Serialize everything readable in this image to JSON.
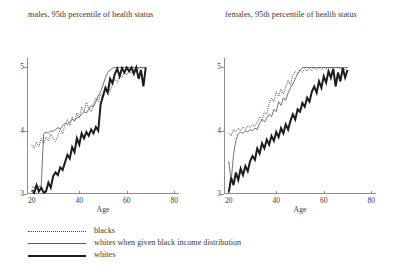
{
  "chart_data": [
    {
      "type": "line",
      "title": "males, 95th percentile of health status",
      "xlabel": "Age",
      "ylabel": "",
      "xlim": [
        18,
        82
      ],
      "ylim": [
        3,
        5.15
      ],
      "xticks": [
        20,
        40,
        60,
        80
      ],
      "yticks": [
        3,
        4,
        5
      ],
      "grid": false,
      "legend_position": "below-figure",
      "series": [
        {
          "name": "blacks",
          "style": "dotted",
          "x": [
            20,
            21,
            22,
            23,
            24,
            25,
            26,
            27,
            28,
            29,
            30,
            31,
            32,
            33,
            34,
            35,
            36,
            37,
            38,
            39,
            40,
            41,
            42,
            43,
            44,
            45,
            46,
            47,
            48,
            49,
            50,
            51,
            52,
            53,
            54,
            55,
            56,
            57,
            58,
            59,
            60,
            61,
            62,
            63,
            64,
            65,
            66,
            67,
            68
          ],
          "values": [
            3.78,
            3.72,
            3.82,
            3.75,
            3.88,
            3.8,
            3.9,
            3.84,
            3.95,
            3.88,
            3.83,
            3.92,
            4.02,
            3.95,
            4.1,
            4.18,
            4.08,
            4.22,
            4.15,
            4.28,
            4.2,
            4.38,
            4.3,
            4.45,
            4.36,
            4.3,
            4.42,
            4.52,
            4.46,
            4.58,
            4.52,
            4.64,
            4.7,
            4.62,
            4.74,
            4.82,
            4.76,
            4.88,
            4.84,
            4.92,
            4.88,
            4.95,
            4.9,
            4.97,
            4.93,
            4.99,
            4.95,
            5.0,
            4.98
          ]
        },
        {
          "name": "whites when given black income distribution",
          "style": "thin-solid",
          "x": [
            20,
            21,
            22,
            23,
            24,
            25,
            26,
            27,
            28,
            29,
            30,
            31,
            32,
            33,
            34,
            35,
            36,
            37,
            38,
            39,
            40,
            41,
            42,
            43,
            44,
            45,
            46,
            47,
            48,
            49,
            50,
            51,
            52,
            53,
            54,
            55,
            56,
            57,
            58,
            59,
            60,
            61,
            62,
            63,
            64,
            65,
            66,
            67,
            68
          ],
          "values": [
            3.12,
            3.1,
            3.13,
            3.11,
            3.14,
            3.95,
            3.98,
            3.96,
            4.0,
            3.99,
            4.02,
            4.05,
            4.03,
            4.08,
            4.12,
            4.1,
            4.14,
            4.18,
            4.16,
            4.2,
            4.22,
            4.26,
            4.3,
            4.28,
            4.34,
            4.4,
            4.38,
            4.46,
            4.55,
            4.62,
            4.72,
            4.84,
            4.92,
            4.96,
            4.99,
            5.0,
            5.0,
            5.0,
            5.0,
            5.0,
            5.0,
            5.0,
            5.0,
            5.0,
            5.0,
            5.0,
            5.0,
            5.0,
            5.0
          ]
        },
        {
          "name": "whites",
          "style": "thick-solid",
          "x": [
            20,
            21,
            22,
            23,
            24,
            25,
            26,
            27,
            28,
            29,
            30,
            31,
            32,
            33,
            34,
            35,
            36,
            37,
            38,
            39,
            40,
            41,
            42,
            43,
            44,
            45,
            46,
            47,
            48,
            49,
            50,
            51,
            52,
            53,
            54,
            55,
            56,
            57,
            58,
            59,
            60,
            61,
            62,
            63,
            64,
            65,
            66,
            67,
            68
          ],
          "values": [
            3.06,
            3.02,
            3.14,
            3.04,
            3.1,
            3.02,
            3.04,
            3.18,
            3.1,
            3.28,
            3.34,
            3.3,
            3.42,
            3.38,
            3.5,
            3.62,
            3.56,
            3.74,
            3.66,
            3.88,
            3.78,
            3.96,
            3.88,
            3.98,
            3.92,
            4.02,
            3.96,
            4.06,
            4.0,
            4.42,
            4.55,
            4.68,
            4.6,
            4.82,
            4.75,
            4.9,
            4.98,
            4.86,
            4.99,
            4.92,
            5.0,
            4.94,
            5.0,
            4.9,
            5.0,
            4.82,
            4.96,
            4.7,
            5.0
          ]
        }
      ]
    },
    {
      "type": "line",
      "title": "females, 95th percentile of health status",
      "xlabel": "Age",
      "ylabel": "",
      "xlim": [
        18,
        82
      ],
      "ylim": [
        3,
        5.15
      ],
      "xticks": [
        20,
        40,
        60,
        80
      ],
      "yticks": [
        3,
        4,
        5
      ],
      "grid": false,
      "legend_position": "below-figure",
      "series": [
        {
          "name": "blacks",
          "style": "dotted",
          "x": [
            20,
            21,
            22,
            23,
            24,
            25,
            26,
            27,
            28,
            29,
            30,
            31,
            32,
            33,
            34,
            35,
            36,
            37,
            38,
            39,
            40,
            41,
            42,
            43,
            44,
            45,
            46,
            47,
            48,
            49,
            50,
            51,
            52,
            53,
            54,
            55,
            56,
            57,
            58,
            59,
            60,
            61,
            62,
            63,
            64,
            65,
            66,
            67,
            68,
            69,
            70
          ],
          "values": [
            3.96,
            3.92,
            4.02,
            3.98,
            4.04,
            4.0,
            4.06,
            4.02,
            4.08,
            4.05,
            4.1,
            4.07,
            4.14,
            4.22,
            4.16,
            4.3,
            4.26,
            4.42,
            4.52,
            4.46,
            4.62,
            4.54,
            4.66,
            4.58,
            4.7,
            4.8,
            4.72,
            4.88,
            4.94,
            4.9,
            4.96,
            4.92,
            4.98,
            4.94,
            4.99,
            4.95,
            5.0,
            4.96,
            5.0,
            4.97,
            5.0,
            4.98,
            5.0,
            4.99,
            5.0,
            5.0,
            5.0,
            4.98,
            5.0,
            4.96,
            5.0
          ]
        },
        {
          "name": "whites when given black income distribution",
          "style": "thin-solid",
          "x": [
            20,
            21,
            22,
            23,
            24,
            25,
            26,
            27,
            28,
            29,
            30,
            31,
            32,
            33,
            34,
            35,
            36,
            37,
            38,
            39,
            40,
            41,
            42,
            43,
            44,
            45,
            46,
            47,
            48,
            49,
            50,
            51,
            52,
            53,
            54,
            55,
            56,
            57,
            58,
            59,
            60,
            61,
            62,
            63,
            64,
            65,
            66,
            67,
            68,
            69,
            70
          ],
          "values": [
            3.52,
            3.2,
            3.62,
            3.85,
            3.95,
            3.98,
            3.96,
            4.0,
            3.98,
            4.02,
            4.0,
            4.04,
            4.02,
            4.12,
            4.18,
            4.14,
            4.2,
            4.26,
            4.22,
            4.34,
            4.3,
            4.46,
            4.4,
            4.52,
            4.48,
            4.6,
            4.68,
            4.74,
            4.82,
            4.9,
            4.96,
            5.0,
            5.0,
            5.0,
            5.0,
            5.0,
            5.0,
            5.0,
            5.0,
            5.0,
            5.0,
            5.0,
            5.0,
            5.0,
            5.0,
            5.0,
            5.0,
            5.0,
            5.0,
            5.0,
            5.0
          ]
        },
        {
          "name": "whites",
          "style": "thick-solid",
          "x": [
            20,
            21,
            22,
            23,
            24,
            25,
            26,
            27,
            28,
            29,
            30,
            31,
            32,
            33,
            34,
            35,
            36,
            37,
            38,
            39,
            40,
            41,
            42,
            43,
            44,
            45,
            46,
            47,
            48,
            49,
            50,
            51,
            52,
            53,
            54,
            55,
            56,
            57,
            58,
            59,
            60,
            61,
            62,
            63,
            64,
            65,
            66,
            67,
            68,
            69,
            70
          ],
          "values": [
            3.02,
            3.26,
            3.14,
            3.34,
            3.22,
            3.4,
            3.3,
            3.44,
            3.36,
            3.52,
            3.6,
            3.54,
            3.72,
            3.64,
            3.8,
            3.72,
            3.86,
            3.78,
            3.92,
            3.84,
            3.98,
            3.9,
            4.04,
            3.96,
            4.1,
            4.02,
            4.16,
            4.26,
            4.18,
            4.34,
            4.3,
            4.44,
            4.38,
            4.52,
            4.46,
            4.62,
            4.7,
            4.6,
            4.78,
            4.68,
            4.86,
            4.76,
            4.94,
            4.84,
            4.98,
            4.7,
            4.92,
            4.78,
            4.99,
            4.84,
            4.96
          ]
        }
      ]
    }
  ],
  "legend": {
    "items": [
      {
        "label": "blacks",
        "style": "dotted"
      },
      {
        "label": "whites when given black income distribution",
        "style": "thin-solid"
      },
      {
        "label": "whites",
        "style": "thick-solid"
      }
    ]
  }
}
